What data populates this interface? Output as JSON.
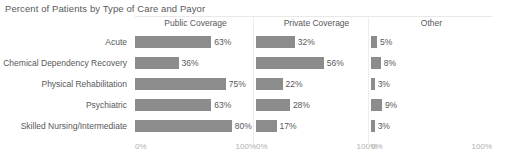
{
  "title": "Percent of Patients by Type of Care and Payor",
  "axis": {
    "start_label": "0%",
    "end_label": "100%"
  },
  "colors": {
    "bar": "#8c8c8c",
    "text": "#58585a",
    "tick": "#b0b0b0",
    "rule": "#e8e8e8"
  },
  "chart_data": {
    "type": "bar",
    "title": "Percent of Patients by Type of Care and Payor",
    "xlabel": "",
    "ylabel": "",
    "xlim": [
      0,
      100
    ],
    "grid": false,
    "legend": "none",
    "orientation": "horizontal",
    "panels": [
      "Public Coverage",
      "Private Coverage",
      "Other"
    ],
    "categories": [
      "Acute",
      "Chemical Dependency Recovery",
      "Physical Rehabilitation",
      "Psychiatric",
      "Skilled Nursing/Intermediate"
    ],
    "series": [
      {
        "name": "Public Coverage",
        "values": [
          63,
          36,
          75,
          63,
          80
        ],
        "labels": [
          "63%",
          "36%",
          "75%",
          "63%",
          "80%"
        ]
      },
      {
        "name": "Private Coverage",
        "values": [
          32,
          56,
          22,
          28,
          17
        ],
        "labels": [
          "32%",
          "56%",
          "22%",
          "28%",
          "17%"
        ]
      },
      {
        "name": "Other",
        "values": [
          5,
          8,
          3,
          9,
          3
        ],
        "labels": [
          "5%",
          "8%",
          "3%",
          "9%",
          "3%"
        ]
      }
    ]
  }
}
